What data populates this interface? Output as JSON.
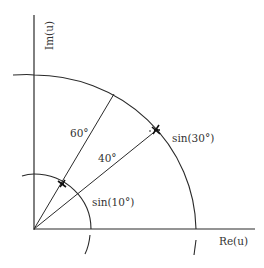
{
  "diagram": {
    "axes": {
      "y_label": "Im(u)",
      "x_label": "Re(u)"
    },
    "angles": {
      "large": "60°",
      "small": "40°"
    },
    "arcs": {
      "outer_label": "sin(30°)",
      "inner_label": "sin(10°)"
    },
    "colors": {
      "stroke": "#2a2a2a",
      "text": "#333333",
      "background": "#ffffff"
    }
  }
}
